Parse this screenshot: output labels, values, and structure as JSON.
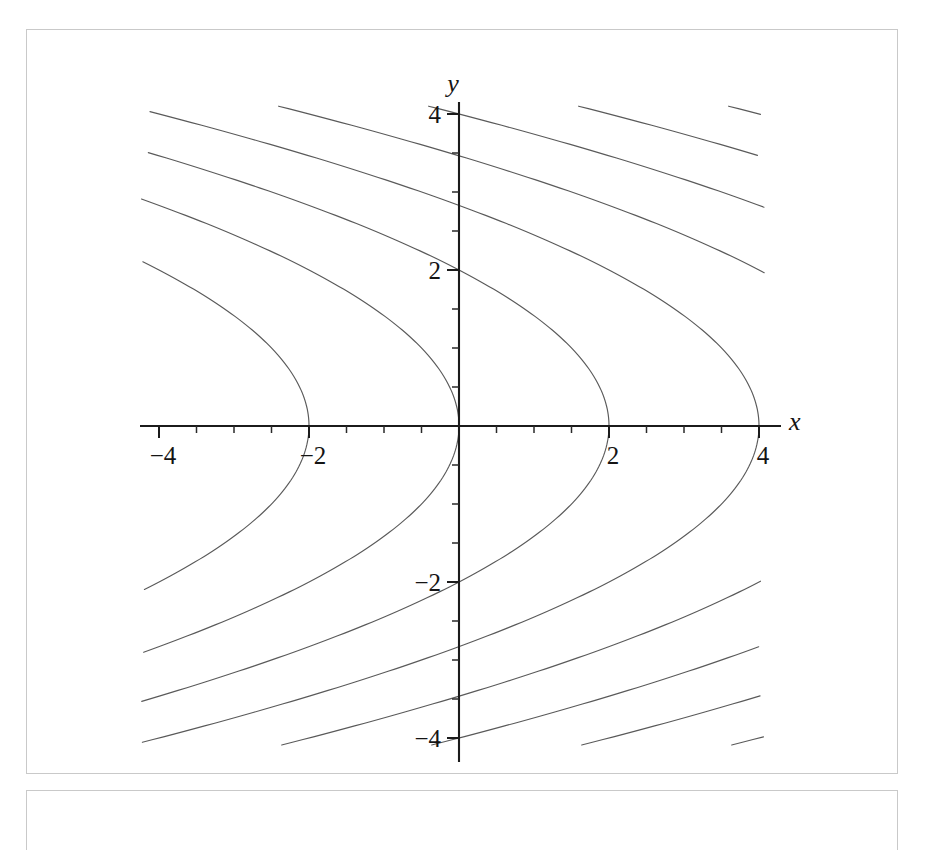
{
  "figure": {
    "kind": "contour-plot",
    "background_color": "#ffffff",
    "frame_color": "#c9c9c9",
    "axis_color": "#1b1b1b",
    "curve_color": "#5a5a5a"
  },
  "axes": {
    "x_label": "x",
    "y_label": "y",
    "x_ticks": [
      "-4",
      "-2",
      "2",
      "4"
    ],
    "y_ticks": [
      "4",
      "2",
      "-2",
      "-4"
    ]
  },
  "chart_data": {
    "type": "line",
    "title": "",
    "xlabel": "x",
    "ylabel": "y",
    "xlim": [
      -4.05,
      4.05
    ],
    "ylim": [
      -4.05,
      4.05
    ],
    "grid": false,
    "legend": "none",
    "x_ticks": [
      -4,
      -2,
      2,
      4
    ],
    "y_ticks": [
      4,
      2,
      -2,
      -4
    ],
    "x_tick_labels": [
      "-4",
      "-2",
      "2",
      "4"
    ],
    "y_tick_labels": [
      "4",
      "2",
      "-2",
      "-4"
    ],
    "x_minor_tick_step": 0.5,
    "y_minor_tick_step": 0.5,
    "contour_relation": "x = c - y^2/2",
    "contour_levels": [
      -2,
      0,
      2,
      4,
      6,
      8,
      10,
      12,
      14,
      16,
      18
    ],
    "series": [
      {
        "name": "c = -2",
        "level": -2,
        "vertex": [
          -2,
          0
        ],
        "shade": 0.72
      },
      {
        "name": "c = 0",
        "level": 0,
        "vertex": [
          0,
          0
        ],
        "shade": 0.68
      },
      {
        "name": "c = 2",
        "level": 2,
        "vertex": [
          2,
          0
        ],
        "shade": 0.64
      },
      {
        "name": "c = 4",
        "level": 4,
        "vertex": [
          4,
          0
        ],
        "shade": 0.6
      },
      {
        "name": "c = 6",
        "level": 6,
        "vertex": [
          6,
          0
        ],
        "shade": 0.54
      },
      {
        "name": "c = 8",
        "level": 8,
        "vertex": [
          8,
          0
        ],
        "shade": 0.48
      },
      {
        "name": "c = 10",
        "level": 10,
        "vertex": [
          10,
          0
        ],
        "shade": 0.42
      },
      {
        "name": "c = 12",
        "level": 12,
        "vertex": [
          12,
          0
        ],
        "shade": 0.36
      },
      {
        "name": "c = 14",
        "level": 14,
        "vertex": [
          14,
          0
        ],
        "shade": 0.3
      },
      {
        "name": "c = 16",
        "level": 16,
        "vertex": [
          16,
          0
        ],
        "shade": 0.24
      },
      {
        "name": "c = 18",
        "level": 18,
        "vertex": [
          18,
          0
        ],
        "shade": 0.18
      }
    ]
  }
}
